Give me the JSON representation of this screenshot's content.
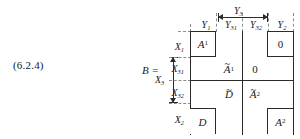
{
  "figure": {
    "equation_number": "(6.2.4)",
    "matrix_label": "B =",
    "column_headers": [
      {
        "id": "y1",
        "base": "Y",
        "sub": "1"
      },
      {
        "id": "y31",
        "base": "Y",
        "sub": "31"
      },
      {
        "id": "y32",
        "base": "Y",
        "sub": "32"
      },
      {
        "id": "y2",
        "base": "Y",
        "sub": "2"
      }
    ],
    "column_span": {
      "id": "y3",
      "base": "Y",
      "sub": "3",
      "covers": [
        "y31",
        "y32"
      ]
    },
    "row_headers": [
      {
        "id": "x1",
        "base": "X",
        "sub": "1"
      },
      {
        "id": "x31",
        "base": "X",
        "sub": "31"
      },
      {
        "id": "x32",
        "base": "X",
        "sub": "32"
      },
      {
        "id": "x2",
        "base": "X",
        "sub": "2"
      }
    ],
    "row_span": {
      "id": "x3",
      "base": "X",
      "sub": "3",
      "covers": [
        "x31",
        "x32"
      ]
    },
    "cells": {
      "top_left": {
        "base": "A",
        "sup": "1",
        "tilde": false
      },
      "top_right": {
        "base": "0",
        "sup": "",
        "tilde": false
      },
      "mid_upper_left": {
        "base": "A",
        "sup": "1",
        "tilde": true
      },
      "mid_upper_right": {
        "base": "0",
        "sup": "",
        "tilde": false
      },
      "mid_lower_left": {
        "base": "D",
        "sup": "",
        "tilde": true
      },
      "mid_lower_right": {
        "base": "A",
        "sup": "2",
        "tilde": true
      },
      "bottom_left": {
        "base": "D",
        "sup": "",
        "tilde": false
      },
      "bottom_right": {
        "base": "A",
        "sup": "2",
        "tilde": false
      }
    },
    "colors": {
      "ink": "#1a1a1a",
      "rule": "#2b2b2b",
      "guide": "#8d8d8d",
      "background": "#ffffff"
    }
  }
}
